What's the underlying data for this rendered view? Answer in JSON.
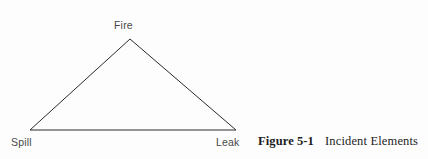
{
  "figure": {
    "diagram_type": "triangle",
    "vertices": [
      {
        "id": "apex",
        "label": "Fire",
        "x": 130,
        "y": 39
      },
      {
        "id": "bottom-left",
        "label": "Spill",
        "x": 30,
        "y": 130
      },
      {
        "id": "bottom-right",
        "label": "Leak",
        "x": 236,
        "y": 130
      }
    ],
    "stroke_color": "#2b2b2b",
    "stroke_width": 1,
    "background_color": "#fdfdfd",
    "label_color": "#4a4a4a"
  },
  "caption": {
    "number": "Figure 5-1",
    "title": "Incident Elements",
    "color": "#1d1d1d"
  }
}
